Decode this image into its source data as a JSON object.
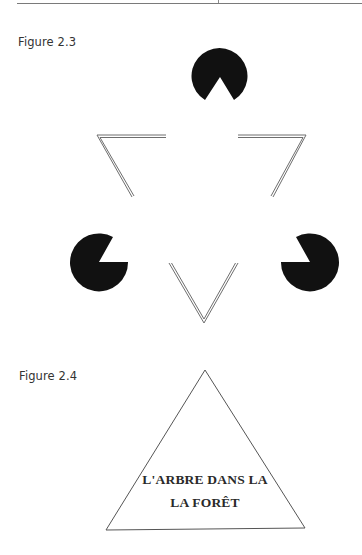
{
  "page": {
    "header_rule": true
  },
  "figures": [
    {
      "label": "Figure 2.3",
      "description": "Kanizsa triangle illusion: three black pac-man discs and three double-line V corners",
      "pacmen": [
        {
          "name": "top",
          "cx": 220,
          "cy": 76,
          "r": 28,
          "mouth": "down"
        },
        {
          "name": "left",
          "cx": 99,
          "cy": 262,
          "r": 29,
          "mouth": "upper-right"
        },
        {
          "name": "right",
          "cx": 310,
          "cy": 262,
          "r": 29,
          "mouth": "upper-left"
        }
      ],
      "colors": {
        "disc": "#111111",
        "line": "#6e6e6e"
      }
    },
    {
      "label": "Figure 2.4",
      "description": "Triangle containing text with repeated word",
      "text_lines": [
        "L'ARBRE DANS LA",
        "LA FORÊT"
      ],
      "colors": {
        "stroke": "#555555",
        "text": "#2a2a2a"
      }
    }
  ]
}
